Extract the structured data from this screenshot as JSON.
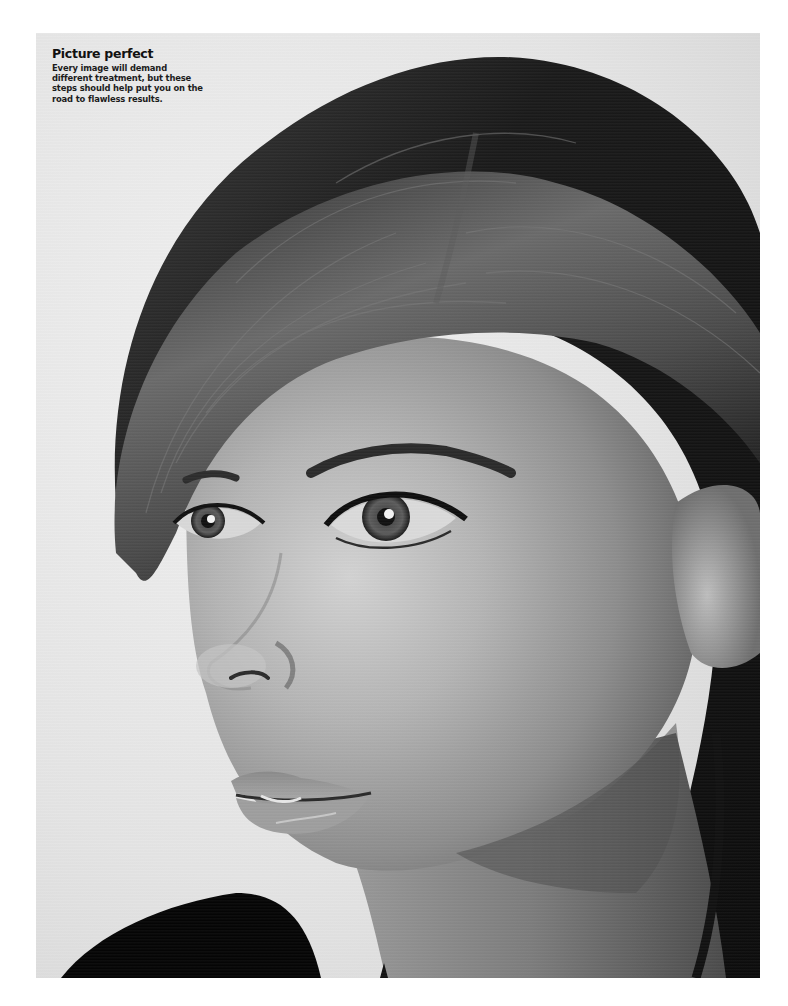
{
  "page": {
    "background": "#ffffff"
  },
  "caption": {
    "title": "Picture perfect",
    "body_lines": [
      "Every image will demand",
      "different treatment, but these",
      "steps should help put you on the",
      "road to flawless results."
    ]
  },
  "photo": {
    "subject": "black-and-white portrait of a young woman",
    "backdrop_color": "#e7e7e7",
    "hair_color": "#151515",
    "skin_tone": "#a9a9a9",
    "clothing_color": "#050505"
  }
}
